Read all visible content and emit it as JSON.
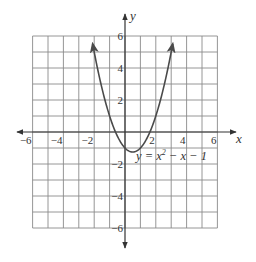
{
  "chart_data": {
    "type": "line",
    "title": "",
    "equation": "y = x² − x − 1",
    "equation_parts": {
      "lhs": "y = x",
      "sup": "2",
      "rhs": " − x − 1"
    },
    "xlabel": "x",
    "ylabel": "y",
    "xlim": [
      -6,
      6
    ],
    "ylim": [
      -6,
      6
    ],
    "grid": true,
    "legend": "none",
    "x_ticks": [
      -6,
      -4,
      -2,
      2,
      4,
      6
    ],
    "x_tick_labels": [
      "−6",
      "−4",
      "−2",
      "2",
      "4",
      "6"
    ],
    "y_ticks": [
      6,
      4,
      2,
      -2,
      -4,
      -6
    ],
    "y_tick_labels": [
      "6",
      "4",
      "2",
      "−2",
      "−4",
      "−6"
    ],
    "series": [
      {
        "name": "y = x^2 - x - 1",
        "x": [
          -2.1,
          -2,
          -1.5,
          -1,
          -0.5,
          0,
          0.5,
          1,
          1.5,
          2,
          2.5,
          3,
          3.1
        ],
        "y": [
          5.51,
          5,
          2.75,
          1,
          -0.25,
          -1,
          -1.25,
          -1,
          -0.25,
          1,
          2.75,
          5,
          5.51
        ],
        "arrows_both_ends": true
      }
    ],
    "vertex": [
      0.5,
      -1.25
    ]
  },
  "colors": {
    "grid": "#8a8a8a",
    "axis": "#333333",
    "curve": "#4a4a4a",
    "text": "#333333"
  }
}
